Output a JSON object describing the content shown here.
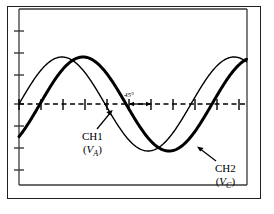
{
  "figure": {
    "title": "",
    "type": "oscilloscope-waveform-diagram",
    "background_color": "#ffffff",
    "line_color": "#000000",
    "frame_color": "#231f20"
  },
  "annotations": {
    "phase_angle": {
      "text": "45°",
      "name": "phase-angle-label"
    },
    "ch1": {
      "line1": "CH1",
      "v": "V",
      "subscript": "A",
      "open_paren": "(",
      "close_paren": ")"
    },
    "ch2": {
      "line1": "CH2",
      "v": "V",
      "subscript": "C",
      "open_paren": "(",
      "close_paren": ")"
    }
  },
  "chart_data": {
    "type": "line",
    "title": "",
    "xlabel": "",
    "ylabel": "",
    "grid": false,
    "legend_position": "inline-annotations",
    "axis": {
      "x_range_px": [
        19,
        247
      ],
      "y_range_px": [
        9,
        185
      ],
      "zero_line_y_px": 104,
      "x_tick_spacing_px": 22,
      "y_tick_spacing_px": 22,
      "x_ticks_px": [
        19,
        41,
        63,
        85,
        107,
        129,
        151,
        173,
        195,
        217,
        239
      ],
      "y_ticks_px": [
        31,
        53,
        75,
        97,
        104,
        126,
        148,
        170
      ],
      "zero_line_style": "dashed"
    },
    "series": [
      {
        "name": "CH1",
        "label": "CH1 (V_A)",
        "stroke_width": 1.4,
        "waveform": "sine",
        "amplitude_px": 47,
        "period_px": 172,
        "phase_deg": 0,
        "zero_crossing_px": 19,
        "peak_x_px": 62,
        "peak_y_px": 57,
        "trough_x_px": 148,
        "trough_y_px": 151
      },
      {
        "name": "CH2",
        "label": "CH2 (V_C)",
        "stroke_width": 3.0,
        "waveform": "sine",
        "amplitude_px": 47,
        "period_px": 172,
        "phase_deg": -45,
        "zero_crossing_px": 40,
        "peak_x_px": 83,
        "peak_y_px": 57,
        "trough_x_px": 169,
        "trough_y_px": 151
      }
    ],
    "phase_difference_deg": 45,
    "phase_marker": {
      "from_x_px": 129,
      "to_x_px": 150,
      "y_px": 104,
      "label": "45°"
    }
  }
}
